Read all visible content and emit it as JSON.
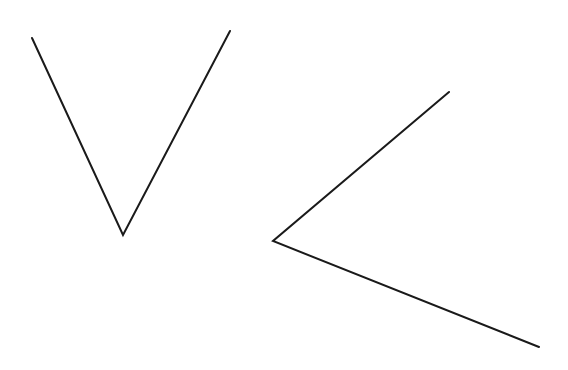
{
  "diagram": {
    "type": "angles",
    "stroke_color": "#1a1a1a",
    "stroke_width": 2,
    "background": "#ffffff",
    "angles": [
      {
        "name": "angle-v",
        "arm1": [
          32,
          38
        ],
        "vertex": [
          123,
          235
        ],
        "arm2": [
          230,
          31
        ]
      },
      {
        "name": "angle-sideways",
        "arm1": [
          449,
          92
        ],
        "vertex": [
          273,
          241
        ],
        "arm2": [
          539,
          347
        ]
      }
    ]
  }
}
